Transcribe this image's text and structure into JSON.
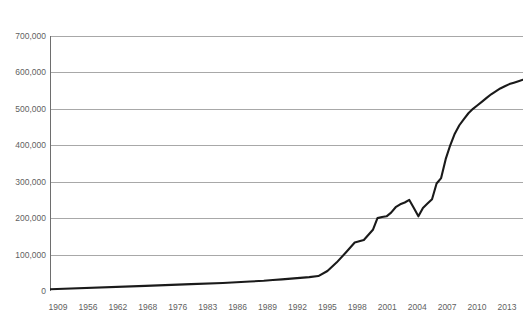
{
  "chart_data": {
    "type": "line",
    "title": "",
    "subtitle": "",
    "xlabel": "",
    "ylabel": "",
    "ylim": [
      0,
      700000
    ],
    "xlim": [
      1909,
      2013
    ],
    "grid": true,
    "legend": false,
    "legend_position": "none",
    "line_color": "#1a1a1a",
    "grid_color": "#a8a8a8",
    "axis_color": "#6e6e6e",
    "background_color": "#ffffff",
    "y_ticks": [
      0,
      100000,
      200000,
      300000,
      400000,
      500000,
      600000,
      700000
    ],
    "y_tick_labels": [
      "0",
      "100,000",
      "200,000",
      "300,000",
      "400,000",
      "500,000",
      "600,000",
      "700,000"
    ],
    "x_tick_labels": [
      "1909",
      "1956",
      "1962",
      "1968",
      "1976",
      "1983",
      "1986",
      "1989",
      "1992",
      "1995",
      "1998",
      "2001",
      "2004",
      "2007",
      "2010",
      "2013"
    ],
    "x": [
      1909,
      1930,
      1940,
      1947,
      1950,
      1953,
      1956,
      1958,
      1960,
      1962,
      1964,
      1966,
      1968,
      1970,
      1972,
      1974,
      1976,
      1978,
      1980,
      1981,
      1982,
      1983,
      1984,
      1985,
      1986,
      1987,
      1988,
      1989,
      1990,
      1991,
      1992,
      1993,
      1994,
      1995,
      1996,
      1997,
      1998,
      1999,
      2000,
      2001,
      2002,
      2003,
      2004,
      2005,
      2006,
      2007,
      2008,
      2009,
      2010,
      2011,
      2012,
      2013
    ],
    "values": [
      5000,
      14000,
      19000,
      22000,
      24000,
      26000,
      28000,
      30000,
      32000,
      34000,
      36000,
      38000,
      41000,
      55000,
      78000,
      105000,
      133000,
      140000,
      168000,
      200000,
      203000,
      205000,
      215000,
      230000,
      238000,
      243000,
      250000,
      228000,
      205000,
      228000,
      240000,
      252000,
      295000,
      310000,
      362000,
      400000,
      432000,
      455000,
      472000,
      488000,
      500000,
      510000,
      520000,
      530000,
      540000,
      548000,
      556000,
      562000,
      568000,
      572000,
      576000,
      580000
    ],
    "annotations": []
  }
}
